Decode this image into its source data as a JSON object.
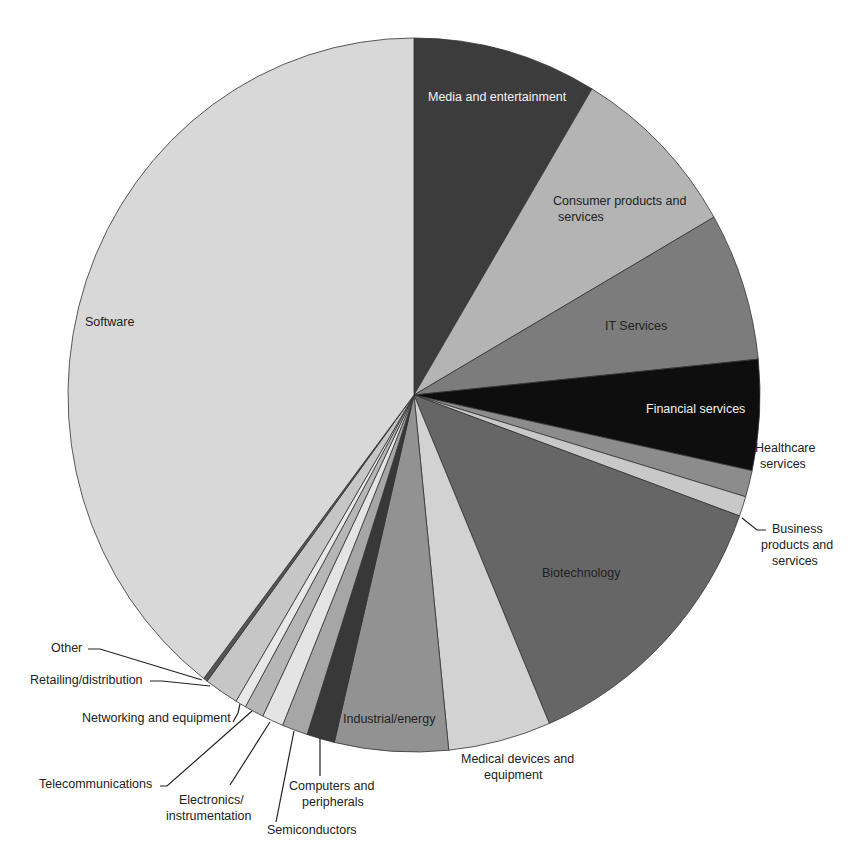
{
  "chart_data": {
    "type": "pie",
    "title": "",
    "start_angle_deg": 0,
    "direction": "clockwise",
    "unit": "%",
    "slices": [
      {
        "label": "Media and entertainment",
        "value": 8.6,
        "color": "#3c3c3c"
      },
      {
        "label": "Consumer products and services",
        "value": 8.1,
        "color": "#b4b4b4"
      },
      {
        "label": "IT Services",
        "value": 6.7,
        "color": "#7c7c7c"
      },
      {
        "label": "Financial services",
        "value": 5.0,
        "color": "#0e0e0e"
      },
      {
        "label": "Healthcare services",
        "value": 1.2,
        "color": "#8c8c8c"
      },
      {
        "label": "Business products and services",
        "value": 0.9,
        "color": "#c8c8c8"
      },
      {
        "label": "Biotechnology",
        "value": 13.1,
        "color": "#666666"
      },
      {
        "label": "Medical devices and equipment",
        "value": 4.8,
        "color": "#d2d2d2"
      },
      {
        "label": "Industrial/energy",
        "value": 5.3,
        "color": "#929292"
      },
      {
        "label": "Computers and peripherals",
        "value": 1.3,
        "color": "#383838"
      },
      {
        "label": "Semiconductors",
        "value": 1.2,
        "color": "#a6a6a6"
      },
      {
        "label": "Electronics/instrumentation",
        "value": 1.0,
        "color": "#e4e4e4"
      },
      {
        "label": "Telecommunications",
        "value": 0.9,
        "color": "#b6b6b6"
      },
      {
        "label": "Networking and equipment",
        "value": 0.5,
        "color": "#e8e8e8"
      },
      {
        "label": "Retailing/distribution",
        "value": 1.6,
        "color": "#c6c6c6"
      },
      {
        "label": "Other",
        "value": 0.2,
        "color": "#555555"
      },
      {
        "label": "Software",
        "value": 39.6,
        "color": "#d8d8d8"
      }
    ]
  },
  "labels": {
    "media": "Media and entertainment",
    "consumer_1": "Consumer products and",
    "consumer_2": "services",
    "it": "IT Services",
    "financial": "Financial services",
    "healthcare_1": "Healthcare",
    "healthcare_2": "services",
    "business_1": "Business",
    "business_2": "products and",
    "business_3": "services",
    "biotech": "Biotechnology",
    "medical_1": "Medical devices and",
    "medical_2": "equipment",
    "industrial": "Industrial/energy",
    "computers_1": "Computers and",
    "computers_2": "peripherals",
    "semiconductors": "Semiconductors",
    "electronics_1": "Electronics/",
    "electronics_2": "instrumentation",
    "telecom": "Telecommunications",
    "networking": "Networking and equipment",
    "retailing": "Retailing/distribution",
    "other": "Other",
    "software": "Software"
  },
  "geometry": {
    "cx": 414,
    "cy": 395,
    "rx": 346,
    "ry": 357
  }
}
